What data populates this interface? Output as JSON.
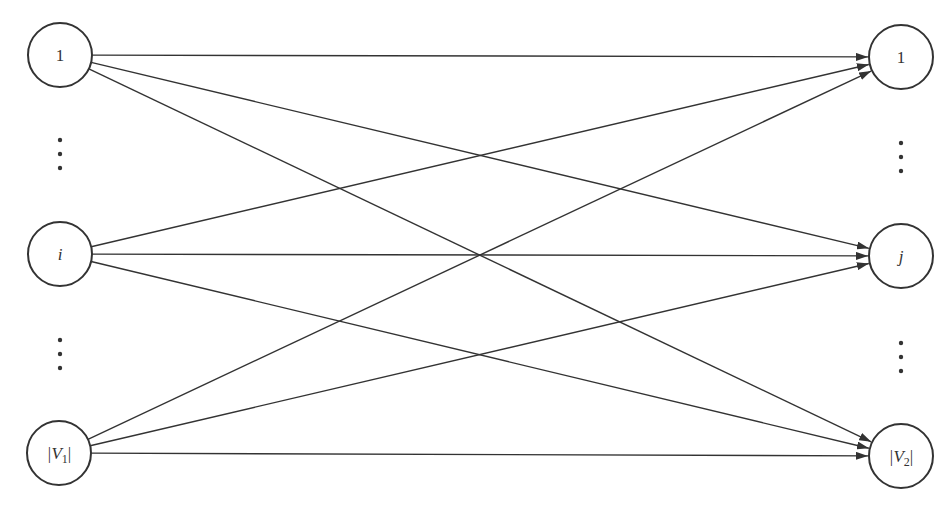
{
  "diagram": {
    "type": "complete bipartite directed graph",
    "left_nodes": [
      {
        "id": "L1",
        "label": "1",
        "italic": false,
        "cx": 60,
        "cy": 55
      },
      {
        "id": "Li",
        "label": "i",
        "italic": true,
        "cx": 60,
        "cy": 254
      },
      {
        "id": "LV1",
        "label": "|V1|",
        "label_main": "|V",
        "label_sub": "1",
        "label_end": "|",
        "italic": true,
        "cx": 59,
        "cy": 453
      }
    ],
    "right_nodes": [
      {
        "id": "R1",
        "label": "1",
        "italic": false,
        "cx": 901,
        "cy": 57
      },
      {
        "id": "Rj",
        "label": "j",
        "italic": true,
        "cx": 901,
        "cy": 256
      },
      {
        "id": "RV2",
        "label": "|V2|",
        "label_main": "|V",
        "label_sub": "2",
        "label_end": "|",
        "italic": true,
        "cx": 901,
        "cy": 456
      }
    ],
    "node_radius": 32,
    "ellipsis": [
      {
        "side": "left",
        "x": 60,
        "ys": [
          140,
          154,
          168
        ]
      },
      {
        "side": "left",
        "x": 60,
        "ys": [
          340,
          354,
          368
        ]
      },
      {
        "side": "right",
        "x": 901,
        "ys": [
          143,
          157,
          171
        ]
      },
      {
        "side": "right",
        "x": 901,
        "ys": [
          343,
          357,
          371
        ]
      }
    ],
    "edges": [
      {
        "from": "L1",
        "to": "R1"
      },
      {
        "from": "L1",
        "to": "Rj"
      },
      {
        "from": "L1",
        "to": "RV2"
      },
      {
        "from": "Li",
        "to": "R1"
      },
      {
        "from": "Li",
        "to": "Rj"
      },
      {
        "from": "Li",
        "to": "RV2"
      },
      {
        "from": "LV1",
        "to": "R1"
      },
      {
        "from": "LV1",
        "to": "Rj"
      },
      {
        "from": "LV1",
        "to": "RV2"
      }
    ],
    "colors": {
      "stroke": "#333333",
      "background": "#ffffff"
    }
  }
}
